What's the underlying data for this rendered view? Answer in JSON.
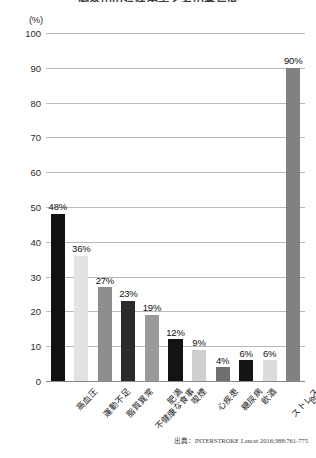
{
  "chart_data": {
    "type": "bar",
    "title": "脳卒中の危険因子とその寄与度",
    "unit_label": "(%)",
    "xlabel": "",
    "ylabel": "",
    "ylim": [
      0,
      100
    ],
    "ytick_step": 10,
    "grid": true,
    "legend": "none",
    "categories": [
      "高血圧",
      "運動不足",
      "脂質異常",
      "不健康な食事",
      "肥満",
      "喫煙",
      "心疾患",
      "糖尿病",
      "飲酒",
      "ストレス",
      "合計"
    ],
    "values": [
      48,
      36,
      27,
      23,
      19,
      12,
      9,
      4,
      6,
      6,
      90
    ],
    "value_labels": [
      "48%",
      "36%",
      "27%",
      "23%",
      "19%",
      "12%",
      "9%",
      "4%",
      "6%",
      "6%",
      "90%"
    ],
    "bar_colors": [
      "#111111",
      "#e2e2e2",
      "#8d8d8d",
      "#2b2b2b",
      "#9a9a9a",
      "#131313",
      "#cfcfcf",
      "#6f6f6f",
      "#141414",
      "#dcdcdc",
      "#818181"
    ],
    "ytick_labels": [
      "0",
      "10",
      "20",
      "30",
      "40",
      "50",
      "60",
      "70",
      "80",
      "90",
      "100"
    ],
    "source": "出典：INTERSTROKE Lancet 2016;388:761-775"
  },
  "colors": {
    "gridline": "#b9b9b9",
    "axis": "#8a8a8a",
    "text": "#1a1a1a",
    "background": "#ffffff"
  }
}
